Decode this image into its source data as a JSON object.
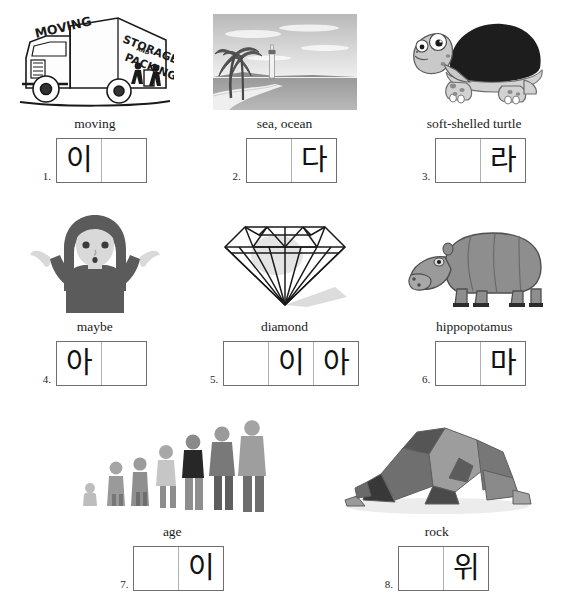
{
  "page": {
    "top_cut_text": "",
    "language": "Korean",
    "worksheet_type": "picture-vocabulary-fill-in-syllable-boxes"
  },
  "items": [
    {
      "number": "1.",
      "caption": "moving",
      "picture": "moving-truck",
      "picture_text": [
        "MOVING",
        "STORAGE",
        "AND",
        "PACKING"
      ],
      "boxes": [
        "이",
        ""
      ]
    },
    {
      "number": "2.",
      "caption": "sea, ocean",
      "picture": "beach-ocean-lighthouse",
      "picture_text": [],
      "boxes": [
        "",
        "다"
      ]
    },
    {
      "number": "3.",
      "caption": "soft-shelled turtle",
      "picture": "turtle",
      "picture_text": [],
      "boxes": [
        "",
        "라"
      ]
    },
    {
      "number": "4.",
      "caption": "maybe",
      "picture": "shrugging-woman",
      "picture_text": [],
      "boxes": [
        "아",
        ""
      ]
    },
    {
      "number": "5.",
      "caption": "diamond",
      "picture": "diamond",
      "picture_text": [],
      "boxes": [
        "",
        "이",
        "아"
      ]
    },
    {
      "number": "6.",
      "caption": "hippopotamus",
      "picture": "hippopotamus",
      "picture_text": [],
      "boxes": [
        "",
        "마"
      ]
    },
    {
      "number": "7.",
      "caption": "age",
      "picture": "people-ages-lineup",
      "picture_text": [],
      "boxes": [
        "",
        "이"
      ]
    },
    {
      "number": "8.",
      "caption": "rock",
      "picture": "rock-pile",
      "picture_text": [],
      "boxes": [
        "",
        "위"
      ]
    }
  ],
  "colors": {
    "box_border": "#6f6f6f",
    "box_divider": "#b0b0b0",
    "text": "#1b1b1b",
    "page_bg": "#ffffff"
  }
}
